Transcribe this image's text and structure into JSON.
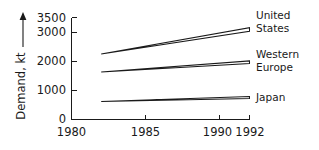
{
  "chart_data": {
    "type": "area",
    "title": "",
    "subtitle": "",
    "xlabel": "",
    "ylabel": "Demand, kt",
    "ylabel_arrow": "up-arrow",
    "xlim": [
      1980,
      1992
    ],
    "ylim": [
      0,
      3500
    ],
    "grid": false,
    "legend_position": "right-inline",
    "x_ticks": [
      {
        "value": 1980,
        "label": "1980"
      },
      {
        "value": 1985,
        "label": "1985"
      },
      {
        "value": 1990,
        "label": "1990"
      },
      {
        "value": 1992,
        "label": "1992"
      }
    ],
    "y_ticks": [
      {
        "value": 0,
        "label": "0"
      },
      {
        "value": 1000,
        "label": "1000"
      },
      {
        "value": 2000,
        "label": "2000"
      },
      {
        "value": 3000,
        "label": "3000"
      },
      {
        "value": 3500,
        "label": "3500"
      }
    ],
    "x_start": 1982,
    "x_end": 1992,
    "series": [
      {
        "name": "united-states",
        "label_line1": "United",
        "label_line2": "States",
        "start_value": 2250,
        "high_end": 3150,
        "low_end": 3030
      },
      {
        "name": "western-europe",
        "label_line1": "Western",
        "label_line2": "Europe",
        "start_value": 1630,
        "high_end": 2010,
        "low_end": 1920
      },
      {
        "name": "japan",
        "label_line1": "Japan",
        "label_line2": "",
        "start_value": 620,
        "high_end": 790,
        "low_end": 720
      }
    ]
  },
  "colors": {
    "ink": "#1a1a1a",
    "background": "#ffffff",
    "band_fill": "#ffffff"
  }
}
